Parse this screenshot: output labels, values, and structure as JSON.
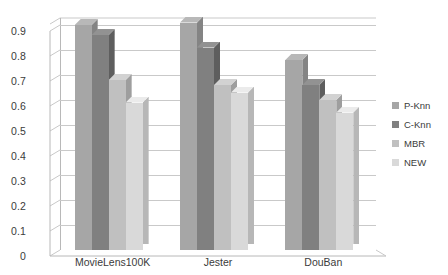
{
  "chart_data": {
    "type": "bar",
    "title": "",
    "subtitle": "",
    "xlabel": "",
    "ylabel": "",
    "categories": [
      "MovieLens100K",
      "Jester",
      "DouBan"
    ],
    "series": [
      {
        "name": "P-Knn",
        "values": [
          0.9,
          0.91,
          0.76
        ],
        "color": "#a6a6a6"
      },
      {
        "name": "C-Knn",
        "values": [
          0.86,
          0.81,
          0.66
        ],
        "color": "#808080"
      },
      {
        "name": "MBR",
        "values": [
          0.68,
          0.66,
          0.6
        ],
        "color": "#c0c0c0"
      },
      {
        "name": "NEW",
        "values": [
          0.59,
          0.63,
          0.55
        ],
        "color": "#d9d9d9"
      }
    ],
    "ylim": [
      0,
      0.9
    ],
    "ytick_labels": [
      "0",
      "0.1",
      "0.2",
      "0.3",
      "0.4",
      "0.5",
      "0.6",
      "0.7",
      "0.8",
      "0.9"
    ],
    "ytick_values": [
      0,
      0.1,
      0.2,
      0.3,
      0.4,
      0.5,
      0.6,
      0.7,
      0.8,
      0.9
    ],
    "grid": true,
    "grid_axis": "y",
    "legend_position": "right",
    "style": "3d-column",
    "background_color": "#ffffff",
    "gridline_color": "#c9c9c9",
    "text_color": "#3b3b3b"
  }
}
